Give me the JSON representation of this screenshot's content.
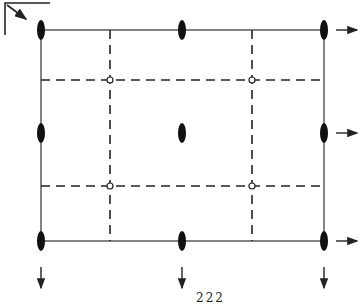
{
  "caption": "222",
  "colors": {
    "line": "#222222",
    "background": "#ffffff"
  },
  "frame": {
    "left": 41,
    "top": 30,
    "right": 324,
    "bottom": 241
  },
  "dashed_lines": {
    "vertical_x": [
      110,
      252
    ],
    "horizontal_y": [
      80,
      186
    ]
  },
  "twofold_axes": [
    {
      "x": 41,
      "y": 30
    },
    {
      "x": 182,
      "y": 30
    },
    {
      "x": 324,
      "y": 30
    },
    {
      "x": 41,
      "y": 133
    },
    {
      "x": 182,
      "y": 133
    },
    {
      "x": 324,
      "y": 133
    },
    {
      "x": 41,
      "y": 241
    },
    {
      "x": 182,
      "y": 241
    },
    {
      "x": 324,
      "y": 241
    }
  ],
  "inversion_centers": [
    {
      "x": 110,
      "y": 80
    },
    {
      "x": 252,
      "y": 80
    },
    {
      "x": 110,
      "y": 186
    },
    {
      "x": 252,
      "y": 186
    }
  ],
  "arrows_right_y": [
    30,
    133,
    241
  ],
  "arrows_down_x": [
    41,
    182,
    324
  ],
  "origin_marker": "corner-with-diagonal-arrow"
}
